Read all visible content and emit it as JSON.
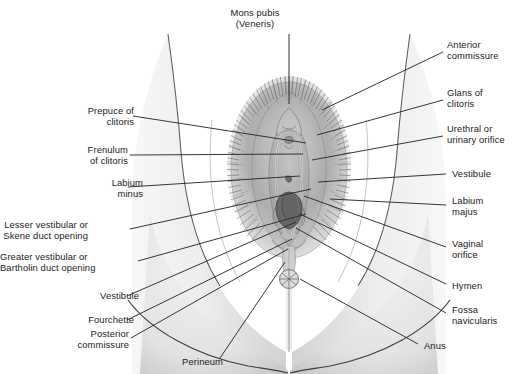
{
  "figure": {
    "style": "grayscale medical illustration with leader lines",
    "colors": {
      "background": "#ffffff",
      "text": "#1a1a1a",
      "leader_line": "#2b2b2b",
      "skin_light": "#eeeeee",
      "skin_mid": "#d9d9d9",
      "skin_shadow": "#bdbdbd",
      "outline": "#4a4a4a",
      "hair_dark": "#555555",
      "orifice_dark": "#5a5a5a"
    }
  },
  "labels": {
    "top": [
      {
        "id": "mons-pubis",
        "lines": [
          "Mons pubis",
          "(Veneris)"
        ],
        "side": "center",
        "x": 255,
        "y": 8,
        "align": "center",
        "leader": [
          [
            289,
            34
          ],
          [
            289,
            104
          ]
        ]
      }
    ],
    "left": [
      {
        "id": "prepuce-of-clitoris",
        "lines": [
          "Prepuce of",
          "clitoris"
        ],
        "x": 66,
        "y": 106,
        "align": "right",
        "leader": [
          [
            133,
            116
          ],
          [
            306,
            143
          ]
        ]
      },
      {
        "id": "frenulum-of-clitoris",
        "lines": [
          "Frenulum",
          "of clitoris"
        ],
        "x": 60,
        "y": 145,
        "align": "right",
        "leader": [
          [
            130,
            155
          ],
          [
            303,
            154
          ]
        ]
      },
      {
        "id": "labium-minus",
        "lines": [
          "Labium",
          "minus"
        ],
        "x": 75,
        "y": 178,
        "align": "right",
        "leader": [
          [
            128,
            187
          ],
          [
            300,
            176
          ]
        ]
      },
      {
        "id": "lesser-vestibular-skene",
        "lines": [
          "Lesser vestibular or",
          "Skene duct opening"
        ],
        "x": 20,
        "y": 220,
        "align": "right",
        "leader": [
          [
            130,
            229
          ],
          [
            311,
            189
          ]
        ]
      },
      {
        "id": "greater-vestibular-bartholin",
        "lines": [
          "Greater vestibular or",
          "Bartholin duct opening"
        ],
        "x": 14,
        "y": 252,
        "align": "right",
        "leader": [
          [
            138,
            261
          ],
          [
            306,
            214
          ]
        ]
      },
      {
        "id": "vestibule-left",
        "lines": [
          "Vestibule"
        ],
        "x": 71,
        "y": 291,
        "align": "right",
        "leader": [
          [
            127,
            296
          ],
          [
            296,
            222
          ]
        ]
      },
      {
        "id": "fourchette",
        "lines": [
          "Fourchette"
        ],
        "x": 66,
        "y": 315,
        "align": "right",
        "leader": [
          [
            127,
            320
          ],
          [
            292,
            239
          ]
        ]
      },
      {
        "id": "posterior-commissure",
        "lines": [
          "Posterior",
          "commissure"
        ],
        "x": 61,
        "y": 329,
        "align": "right",
        "leader": [
          [
            131,
            338
          ],
          [
            288,
            249
          ]
        ]
      },
      {
        "id": "perineum",
        "lines": [
          "Perineum"
        ],
        "x": 155,
        "y": 357,
        "align": "right",
        "leader": [
          [
            220,
            358
          ],
          [
            285,
            262
          ]
        ]
      }
    ],
    "right": [
      {
        "id": "anterior-commissure",
        "lines": [
          "Anterior",
          "commissure"
        ],
        "x": 447,
        "y": 40,
        "align": "left",
        "leader": [
          [
            443,
            52
          ],
          [
            322,
            110
          ]
        ]
      },
      {
        "id": "glans-of-clitoris",
        "lines": [
          "Glans of",
          "clitoris"
        ],
        "x": 447,
        "y": 88,
        "align": "left",
        "leader": [
          [
            443,
            100
          ],
          [
            317,
            135
          ]
        ]
      },
      {
        "id": "urethral-or-urinary-orifice",
        "lines": [
          "Urethral or",
          "urinary orifice"
        ],
        "x": 447,
        "y": 124,
        "align": "left",
        "leader": [
          [
            443,
            136
          ],
          [
            312,
            160
          ]
        ]
      },
      {
        "id": "vestibule-right",
        "lines": [
          "Vestibule"
        ],
        "x": 452,
        "y": 169,
        "align": "left",
        "leader": [
          [
            446,
            174
          ],
          [
            318,
            182
          ]
        ]
      },
      {
        "id": "labium-majus",
        "lines": [
          "Labium",
          "majus"
        ],
        "x": 452,
        "y": 196,
        "align": "left",
        "leader": [
          [
            446,
            205
          ],
          [
            330,
            199
          ]
        ]
      },
      {
        "id": "vaginal-orifice",
        "lines": [
          "Vaginal",
          "orifice"
        ],
        "x": 452,
        "y": 239,
        "align": "left",
        "leader": [
          [
            446,
            247
          ],
          [
            304,
            196
          ]
        ]
      },
      {
        "id": "hymen",
        "lines": [
          "Hymen"
        ],
        "x": 452,
        "y": 281,
        "align": "left",
        "leader": [
          [
            446,
            284
          ],
          [
            300,
            214
          ]
        ]
      },
      {
        "id": "fossa-navicularis",
        "lines": [
          "Fossa",
          "navicularis"
        ],
        "x": 452,
        "y": 305,
        "align": "left",
        "leader": [
          [
            446,
            313
          ],
          [
            296,
            228
          ]
        ]
      },
      {
        "id": "anus",
        "lines": [
          "Anus"
        ],
        "x": 424,
        "y": 341,
        "align": "left",
        "leader": [
          [
            418,
            344
          ],
          [
            300,
            279
          ]
        ]
      }
    ]
  }
}
